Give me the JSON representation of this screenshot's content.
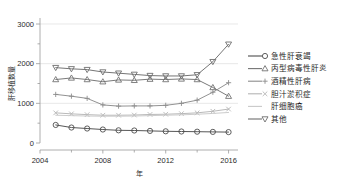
{
  "chart_data": {
    "type": "line",
    "title": "",
    "xlabel": "年",
    "ylabel": "肝移植数量",
    "xlim": [
      2004,
      2016.6
    ],
    "ylim": [
      0,
      3000
    ],
    "yticks": [
      0,
      1000,
      2000,
      3000
    ],
    "ytick_labels": [
      "0",
      "1000",
      "2000",
      "3000"
    ],
    "xticks": [
      2004,
      2008,
      2012,
      2016
    ],
    "xtick_labels": [
      "2004",
      "2008",
      "2012",
      "2016"
    ],
    "minor_yticks": [
      500,
      1500,
      2500
    ],
    "minor_xticks": [
      2006,
      2010,
      2014
    ],
    "grid": "y-major",
    "legend_position": "right",
    "x": [
      2005,
      2006,
      2007,
      2008,
      2009,
      2010,
      2011,
      2012,
      2013,
      2014,
      2015,
      2016
    ],
    "series": [
      {
        "name": "急性肝衰竭",
        "marker": "circle",
        "color": "#4d4d4d",
        "values": [
          455,
          390,
          365,
          340,
          320,
          315,
          305,
          295,
          290,
          285,
          280,
          275
        ]
      },
      {
        "name": "丙型病毒性肝炎",
        "marker": "triangle-up",
        "color": "#737373",
        "values": [
          1600,
          1640,
          1600,
          1545,
          1590,
          1580,
          1610,
          1600,
          1615,
          1600,
          1400,
          1180
        ]
      },
      {
        "name": "酒精性肝病",
        "marker": "plus",
        "color": "#8c8c8c",
        "values": [
          1225,
          1180,
          1125,
          960,
          930,
          935,
          935,
          950,
          1000,
          1080,
          1280,
          1520
        ]
      },
      {
        "name": "胆汁淤积症",
        "marker": "x",
        "color": "#b5b5b5",
        "values": [
          760,
          735,
          715,
          700,
          700,
          705,
          720,
          725,
          740,
          760,
          800,
          855
        ]
      },
      {
        "name": "肝细胞癌",
        "marker": "none",
        "color": "#c9c9c9",
        "values": [
          700,
          690,
          680,
          675,
          675,
          680,
          690,
          700,
          710,
          725,
          745,
          770
        ]
      },
      {
        "name": "其他",
        "marker": "triangle-down",
        "color": "#6e6e6e",
        "values": [
          1900,
          1870,
          1850,
          1790,
          1760,
          1730,
          1700,
          1690,
          1690,
          1720,
          2050,
          2490
        ]
      }
    ]
  },
  "legend": {
    "items": [
      {
        "label": "急性肝衰竭",
        "marker": "circle-icon"
      },
      {
        "label": "丙型病毒性肝炎",
        "marker": "triangle-up-icon"
      },
      {
        "label": "酒精性肝病",
        "marker": "plus-icon"
      },
      {
        "label": "胆汁淤积症",
        "marker": "x-icon"
      },
      {
        "label": "肝细胞癌",
        "marker": "line-icon"
      },
      {
        "label": "其他",
        "marker": "triangle-down-icon"
      }
    ]
  }
}
